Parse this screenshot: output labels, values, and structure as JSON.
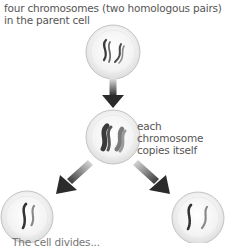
{
  "diagram": {
    "title_label": {
      "line1": "four chromosomes (two homologous pairs)",
      "line2": "in the parent cell"
    },
    "middle_label": {
      "line1": "each",
      "line2": "chromosome",
      "line3": "copies itself"
    },
    "bottom_label_partial": "The cell divides...",
    "nodes": [
      {
        "id": "parent-cell",
        "description": "cell with two homologous pairs of chromosomes"
      },
      {
        "id": "replicated-cell",
        "description": "cell with duplicated chromosomes"
      },
      {
        "id": "daughter-cell-left",
        "description": "daughter cell"
      },
      {
        "id": "daughter-cell-right",
        "description": "daughter cell"
      }
    ],
    "edges": [
      {
        "from": "parent-cell",
        "to": "replicated-cell"
      },
      {
        "from": "replicated-cell",
        "to": "daughter-cell-left"
      },
      {
        "from": "replicated-cell",
        "to": "daughter-cell-right"
      }
    ],
    "colors": {
      "cell_fill": "#f2f2f2",
      "cell_border": "#c8c8c8",
      "chromosome_dark": "#3a3a3a",
      "chromosome_light": "#8a8a8a",
      "arrow": "#2b2b2b",
      "text": "#555555"
    }
  }
}
